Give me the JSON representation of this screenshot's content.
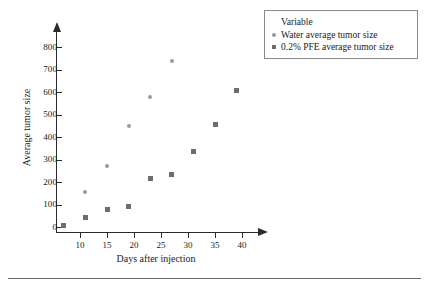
{
  "chart_data": {
    "type": "scatter",
    "title": "",
    "xlabel": "Days after injection",
    "ylabel": "Average tumor size",
    "xlim": [
      5,
      42
    ],
    "ylim": [
      0,
      850
    ],
    "xticks": [
      10,
      15,
      20,
      25,
      30,
      35,
      40
    ],
    "yticks": [
      0,
      100,
      200,
      300,
      400,
      500,
      600,
      700,
      800
    ],
    "grid": false,
    "legend_position": "top-right",
    "legend_title": "Variable",
    "series": [
      {
        "name": "Water average tumor size",
        "marker": "circle",
        "color": "#9a9a9a",
        "points": [
          {
            "x": 7,
            "y": 5
          },
          {
            "x": 11,
            "y": 155
          },
          {
            "x": 15,
            "y": 270
          },
          {
            "x": 19,
            "y": 450
          },
          {
            "x": 23,
            "y": 580
          },
          {
            "x": 27,
            "y": 740
          }
        ]
      },
      {
        "name": "0.2% PFE average tumor size",
        "marker": "square",
        "color": "#6e6e6e",
        "points": [
          {
            "x": 7,
            "y": 5
          },
          {
            "x": 11,
            "y": 42
          },
          {
            "x": 15,
            "y": 80
          },
          {
            "x": 19,
            "y": 93
          },
          {
            "x": 23,
            "y": 215
          },
          {
            "x": 27,
            "y": 235
          },
          {
            "x": 31,
            "y": 335
          },
          {
            "x": 35,
            "y": 455
          },
          {
            "x": 39,
            "y": 605
          }
        ]
      }
    ]
  },
  "legend": {
    "title": "Variable",
    "entries": [
      {
        "label": "Water average tumor size",
        "marker": "circle"
      },
      {
        "label": "0.2% PFE average tumor size",
        "marker": "square"
      }
    ]
  },
  "axes": {
    "y_title": "Average tumor size",
    "x_title": "Days after injection",
    "y_tick_labels": [
      "0",
      "100",
      "200",
      "300",
      "400",
      "500",
      "600",
      "700",
      "800"
    ],
    "x_tick_labels": [
      "10",
      "15",
      "20",
      "25",
      "30",
      "35",
      "40"
    ]
  }
}
